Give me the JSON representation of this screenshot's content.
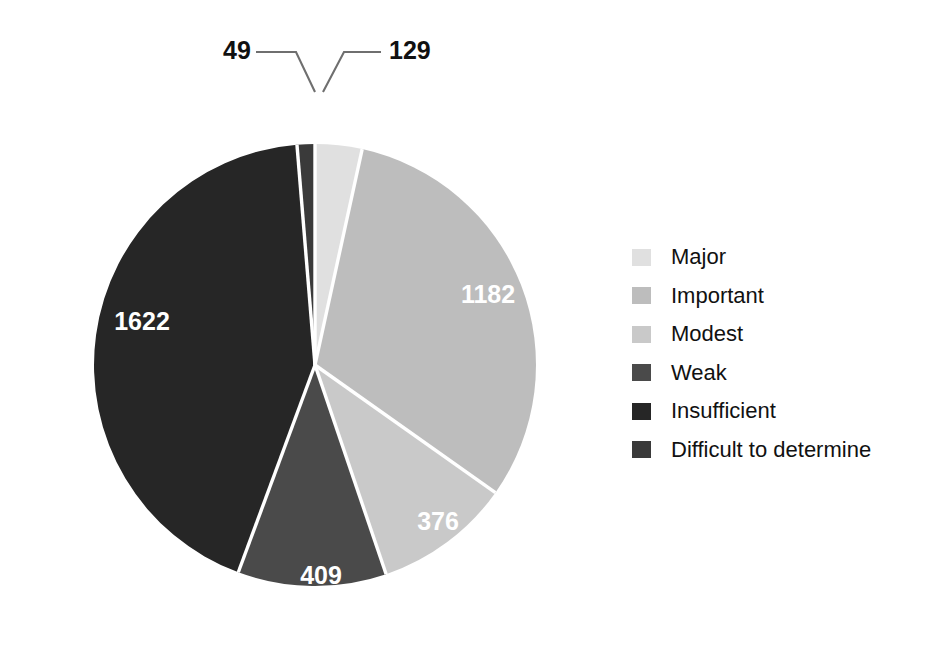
{
  "chart_data": {
    "type": "pie",
    "title": "",
    "subtitle": "",
    "xlabel": "",
    "ylabel": "",
    "legend_position": "right",
    "grid": false,
    "total": 3767,
    "start_angle_deg": 0,
    "direction": "clockwise",
    "categories": [
      "Major",
      "Important",
      "Modest",
      "Weak",
      "Insufficient",
      "Difficult to determine"
    ],
    "values": [
      129,
      1182,
      376,
      409,
      1622,
      49
    ],
    "colors": [
      "#e0e0e0",
      "#bdbdbd",
      "#c9c9c9",
      "#4a4a4a",
      "#262626",
      "#3a3a3a"
    ],
    "slices": [
      {
        "label": "Major",
        "value": 129,
        "value_text": "129",
        "color": "#e0e0e0",
        "label_style": "callout",
        "label_color": "#111111"
      },
      {
        "label": "Important",
        "value": 1182,
        "value_text": "1182",
        "color": "#bdbdbd",
        "label_style": "inside",
        "label_color": "#ffffff"
      },
      {
        "label": "Modest",
        "value": 376,
        "value_text": "376",
        "color": "#c9c9c9",
        "label_style": "inside",
        "label_color": "#ffffff"
      },
      {
        "label": "Weak",
        "value": 409,
        "value_text": "409",
        "color": "#4a4a4a",
        "label_style": "inside",
        "label_color": "#ffffff"
      },
      {
        "label": "Insufficient",
        "value": 1622,
        "value_text": "1622",
        "color": "#262626",
        "label_style": "inside",
        "label_color": "#ffffff"
      },
      {
        "label": "Difficult to determine",
        "value": 49,
        "value_text": "49",
        "color": "#3a3a3a",
        "label_style": "callout",
        "label_color": "#111111"
      }
    ]
  },
  "pie": {
    "value_major": "129",
    "value_important": "1182",
    "value_modest": "376",
    "value_weak": "409",
    "value_insufficient": "1622",
    "value_difficult": "49"
  },
  "legend": {
    "items": [
      {
        "label": "Major",
        "color": "#e0e0e0"
      },
      {
        "label": "Important",
        "color": "#bdbdbd"
      },
      {
        "label": "Modest",
        "color": "#c9c9c9"
      },
      {
        "label": "Weak",
        "color": "#4a4a4a"
      },
      {
        "label": "Insufficient",
        "color": "#262626"
      },
      {
        "label": "Difficult to determine",
        "color": "#3a3a3a"
      }
    ]
  }
}
